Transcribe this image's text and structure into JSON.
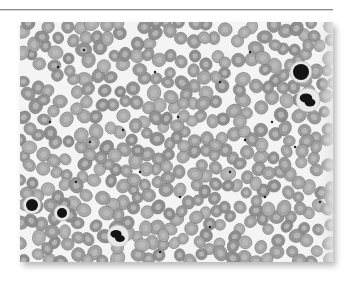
{
  "figure": {
    "palette": {
      "background": "#f4f4f4",
      "rbc_fill": "#9a9a9a",
      "rbc_center": "#bdbdbd",
      "rbc_edge": "#7a7a7a",
      "wbc_nucleus": "#141414",
      "platelet": "#1e1e1e",
      "rule": "#8a8a8a"
    },
    "frame": {
      "x": 20,
      "y": 22,
      "width": 313,
      "height": 240
    },
    "leukocytes": [
      {
        "x": 281,
        "y": 50,
        "r": 8,
        "lobed": false
      },
      {
        "x": 288,
        "y": 78,
        "r": 9,
        "lobed": true
      },
      {
        "x": 12,
        "y": 183,
        "r": 6,
        "lobed": false
      },
      {
        "x": 42,
        "y": 191,
        "r": 5,
        "lobed": false
      },
      {
        "x": 98,
        "y": 214,
        "r": 8,
        "lobed": true
      }
    ],
    "platelets": [
      [
        38,
        45
      ],
      [
        64,
        28
      ],
      [
        103,
        108
      ],
      [
        135,
        50
      ],
      [
        158,
        95
      ],
      [
        200,
        60
      ],
      [
        230,
        30
      ],
      [
        252,
        100
      ],
      [
        275,
        125
      ],
      [
        210,
        150
      ],
      [
        160,
        175
      ],
      [
        120,
        150
      ],
      [
        70,
        120
      ],
      [
        30,
        100
      ],
      [
        245,
        175
      ],
      [
        190,
        205
      ],
      [
        300,
        180
      ],
      [
        140,
        230
      ],
      [
        56,
        160
      ],
      [
        225,
        118
      ]
    ],
    "rbc_seed": 7,
    "rbc_count": 420
  }
}
